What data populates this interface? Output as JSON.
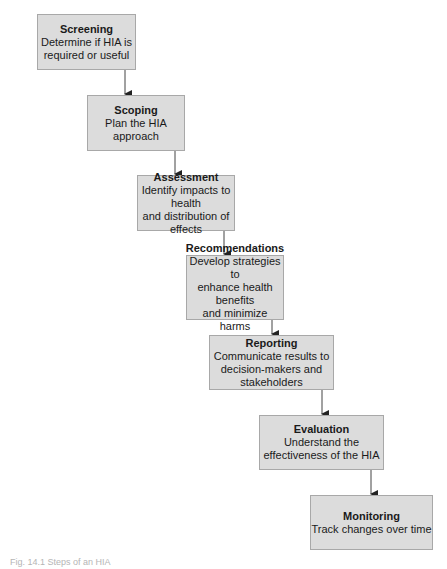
{
  "diagram": {
    "steps": [
      {
        "title": "Screening",
        "description": "Determine if HIA is\nrequired or useful"
      },
      {
        "title": "Scoping",
        "description": "Plan the HIA approach"
      },
      {
        "title": "Assessment",
        "description": "Identify impacts to health\nand distribution of effects"
      },
      {
        "title": "Recommendations",
        "description": "Develop strategies to\nenhance health benefits\nand minimize harms"
      },
      {
        "title": "Reporting",
        "description": "Communicate results to\ndecision-makers and\nstakeholders"
      },
      {
        "title": "Evaluation",
        "description": "Understand the\neffectiveness of the HIA"
      },
      {
        "title": "Monitoring",
        "description": "Track changes over time"
      }
    ],
    "caption": "Fig. 14.1 Steps of an HIA",
    "colors": {
      "box_fill": "#dcdcdc",
      "box_border": "#a8a8a8",
      "connector": "#333333"
    }
  }
}
